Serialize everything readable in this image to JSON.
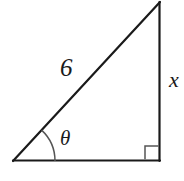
{
  "figure": {
    "name": "right-triangle-diagram",
    "background_color": "#ffffff",
    "stroke_color": "#1a1a1a",
    "marker_color": "#555555",
    "labels": {
      "hypotenuse": "6",
      "vertical_leg": "x",
      "angle": "θ"
    },
    "geometry": {
      "vertex_bottom_left": [
        13,
        161
      ],
      "vertex_bottom_right": [
        160,
        161
      ],
      "vertex_top_right": [
        160,
        2
      ],
      "angle_arc_radius": 42,
      "right_angle_marker_size": 14
    }
  }
}
